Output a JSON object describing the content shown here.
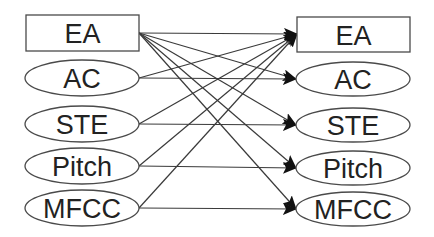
{
  "diagram": {
    "type": "bipartite-feature-graph",
    "left_nodes": [
      {
        "id": "L_EA",
        "label": "EA",
        "shape": "rect",
        "x": 26,
        "y": 15,
        "w": 113,
        "h": 36
      },
      {
        "id": "L_AC",
        "label": "AC",
        "shape": "ellipse",
        "cx": 82,
        "cy": 78,
        "rx": 57,
        "ry": 18
      },
      {
        "id": "L_STE",
        "label": "STE",
        "shape": "ellipse",
        "cx": 82,
        "cy": 124,
        "rx": 57,
        "ry": 18
      },
      {
        "id": "L_Pitch",
        "label": "Pitch",
        "shape": "ellipse",
        "cx": 82,
        "cy": 166,
        "rx": 57,
        "ry": 18
      },
      {
        "id": "L_MFCC",
        "label": "MFCC",
        "shape": "ellipse",
        "cx": 82,
        "cy": 208,
        "rx": 57,
        "ry": 18
      }
    ],
    "right_nodes": [
      {
        "id": "R_EA",
        "label": "EA",
        "shape": "rect",
        "x": 297,
        "y": 17,
        "w": 113,
        "h": 35
      },
      {
        "id": "R_AC",
        "label": "AC",
        "shape": "ellipse",
        "cx": 353,
        "cy": 79,
        "rx": 57,
        "ry": 17
      },
      {
        "id": "R_STE",
        "label": "STE",
        "shape": "ellipse",
        "cx": 353,
        "cy": 125,
        "rx": 57,
        "ry": 17
      },
      {
        "id": "R_Pitch",
        "label": "Pitch",
        "shape": "ellipse",
        "cx": 353,
        "cy": 168,
        "rx": 57,
        "ry": 17
      },
      {
        "id": "R_MFCC",
        "label": "MFCC",
        "shape": "ellipse",
        "cx": 353,
        "cy": 209,
        "rx": 57,
        "ry": 17
      }
    ],
    "edges": [
      {
        "from": "L_EA",
        "to": "R_EA",
        "x1": 139,
        "y1": 33,
        "x2": 297,
        "y2": 34
      },
      {
        "from": "L_EA",
        "to": "R_AC",
        "x1": 139,
        "y1": 33,
        "x2": 296,
        "y2": 79
      },
      {
        "from": "L_EA",
        "to": "R_STE",
        "x1": 139,
        "y1": 33,
        "x2": 296,
        "y2": 125
      },
      {
        "from": "L_EA",
        "to": "R_Pitch",
        "x1": 139,
        "y1": 33,
        "x2": 296,
        "y2": 168
      },
      {
        "from": "L_EA",
        "to": "R_MFCC",
        "x1": 139,
        "y1": 33,
        "x2": 296,
        "y2": 209
      },
      {
        "from": "L_AC",
        "to": "R_EA",
        "x1": 139,
        "y1": 78,
        "x2": 297,
        "y2": 34
      },
      {
        "from": "L_AC",
        "to": "R_AC",
        "x1": 139,
        "y1": 78,
        "x2": 296,
        "y2": 79
      },
      {
        "from": "L_STE",
        "to": "R_EA",
        "x1": 139,
        "y1": 124,
        "x2": 297,
        "y2": 34
      },
      {
        "from": "L_STE",
        "to": "R_STE",
        "x1": 139,
        "y1": 124,
        "x2": 296,
        "y2": 125
      },
      {
        "from": "L_Pitch",
        "to": "R_EA",
        "x1": 139,
        "y1": 166,
        "x2": 297,
        "y2": 34
      },
      {
        "from": "L_Pitch",
        "to": "R_Pitch",
        "x1": 139,
        "y1": 166,
        "x2": 296,
        "y2": 168
      },
      {
        "from": "L_MFCC",
        "to": "R_EA",
        "x1": 139,
        "y1": 208,
        "x2": 297,
        "y2": 34
      },
      {
        "from": "L_MFCC",
        "to": "R_MFCC",
        "x1": 139,
        "y1": 208,
        "x2": 296,
        "y2": 209
      }
    ],
    "colors": {
      "node_stroke": "#4a4a4a",
      "edge": "#3a3a3a",
      "arrowhead": "#111111",
      "text": "#222222",
      "background": "#ffffff"
    }
  }
}
